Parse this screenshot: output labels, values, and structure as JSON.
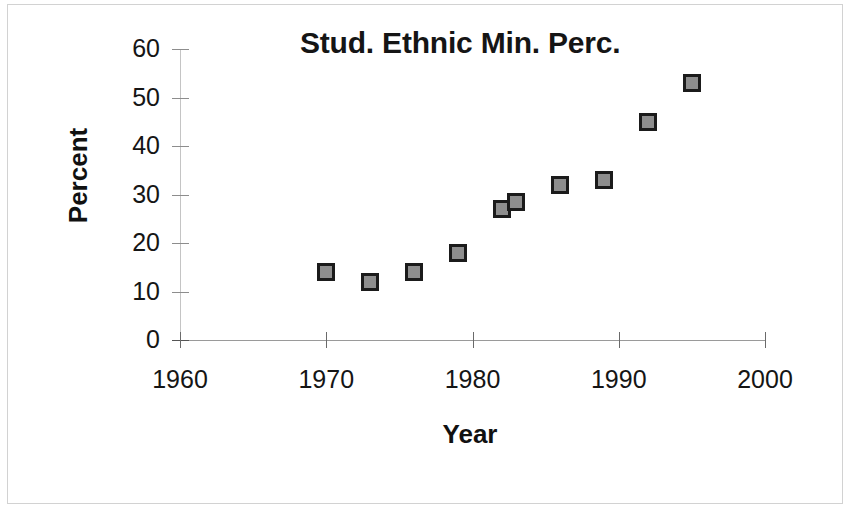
{
  "chart_data": {
    "type": "scatter",
    "title": "Stud. Ethnic Min. Perc.",
    "xlabel": "Year",
    "ylabel": "Percent",
    "xlim": [
      1960,
      2000
    ],
    "ylim": [
      0,
      60
    ],
    "xticks": [
      1960,
      1970,
      1980,
      1990,
      2000
    ],
    "yticks": [
      0,
      10,
      20,
      30,
      40,
      50,
      60
    ],
    "xtick_labels": [
      "1960",
      "1970",
      "1980",
      "1990",
      "2000"
    ],
    "ytick_labels": [
      "0",
      "10",
      "20",
      "30",
      "40",
      "50",
      "60"
    ],
    "grid": false,
    "legend": "none",
    "marker": {
      "shape": "square",
      "fill_color": "#8e8e8e",
      "edge_color": "#1b1b1b",
      "size_px": 14
    },
    "series": [
      {
        "name": "Stud. Ethnic Min. Perc.",
        "points": [
          {
            "x": 1970,
            "y": 14
          },
          {
            "x": 1973,
            "y": 12
          },
          {
            "x": 1976,
            "y": 14
          },
          {
            "x": 1979,
            "y": 18
          },
          {
            "x": 1982,
            "y": 27
          },
          {
            "x": 1983,
            "y": 28.5
          },
          {
            "x": 1986,
            "y": 32
          },
          {
            "x": 1989,
            "y": 33
          },
          {
            "x": 1992,
            "y": 45
          },
          {
            "x": 1995,
            "y": 53
          }
        ]
      }
    ]
  },
  "colors": {
    "background": "#ffffff",
    "text": "#151515",
    "axis": "#8d8d8d",
    "page_border": "#d2d2d2"
  }
}
